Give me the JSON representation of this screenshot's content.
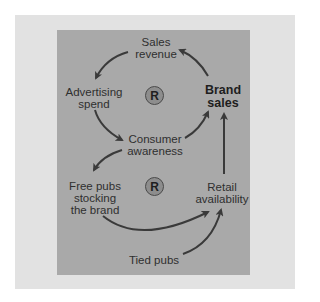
{
  "diagram": {
    "nodes": {
      "sales_revenue": "Sales\nrevenue",
      "advertising_spend": "Advertising\nspend",
      "brand_sales": "Brand\nsales",
      "consumer_awareness": "Consumer\nawareness",
      "free_pubs": "Free pubs\nstocking\nthe brand",
      "retail_availability": "Retail\navailability",
      "tied_pubs": "Tied pubs"
    },
    "loops": [
      {
        "label": "R",
        "type": "reinforcing"
      },
      {
        "label": "R",
        "type": "reinforcing"
      }
    ],
    "edges": [
      {
        "from": "brand_sales",
        "to": "sales_revenue"
      },
      {
        "from": "sales_revenue",
        "to": "advertising_spend"
      },
      {
        "from": "advertising_spend",
        "to": "consumer_awareness"
      },
      {
        "from": "consumer_awareness",
        "to": "brand_sales"
      },
      {
        "from": "consumer_awareness",
        "to": "free_pubs"
      },
      {
        "from": "free_pubs",
        "to": "retail_availability"
      },
      {
        "from": "tied_pubs",
        "to": "retail_availability"
      },
      {
        "from": "retail_availability",
        "to": "brand_sales"
      }
    ],
    "colors": {
      "outer_panel": "#e2e2e2",
      "inner_panel": "#a9a9a9",
      "arrow": "#3a3a3a"
    }
  }
}
